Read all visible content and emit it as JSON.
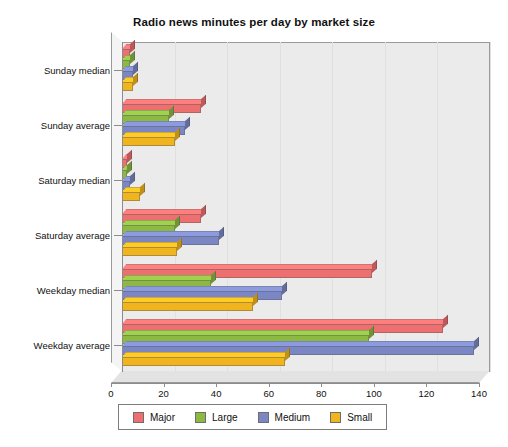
{
  "chart_data": {
    "type": "bar",
    "orientation": "horizontal",
    "title": "Radio news minutes per day by market size",
    "xlabel": "",
    "ylabel": "",
    "xlim": [
      0,
      140
    ],
    "xticks": [
      0,
      20,
      40,
      60,
      80,
      100,
      120,
      140
    ],
    "grid": true,
    "legend_position": "bottom",
    "categories": [
      "Weekday average",
      "Weekday median",
      "Saturday average",
      "Saturday median",
      "Sunday average",
      "Sunday median"
    ],
    "series": [
      {
        "name": "Major",
        "color": "#ee6f6f",
        "values": [
          122,
          95,
          30,
          2,
          30,
          3
        ]
      },
      {
        "name": "Large",
        "color": "#8cb942",
        "values": [
          94,
          34,
          20,
          2,
          18,
          3
        ]
      },
      {
        "name": "Medium",
        "color": "#7b87c4",
        "values": [
          134,
          61,
          37,
          3,
          24,
          4
        ]
      },
      {
        "name": "Small",
        "color": "#f0b41e",
        "values": [
          62,
          50,
          21,
          7,
          20,
          4
        ]
      }
    ]
  },
  "legend": {
    "items": [
      {
        "label": "Major",
        "color": "#ee6f6f"
      },
      {
        "label": "Large",
        "color": "#8cb942"
      },
      {
        "label": "Medium",
        "color": "#7b87c4"
      },
      {
        "label": "Small",
        "color": "#f0b41e"
      }
    ]
  },
  "colors": {
    "plot_background": "#ebebeb",
    "frame": "#9a9a9a",
    "axis": "#8c8c8c",
    "text": "#111111",
    "page_background": "#ffffff"
  }
}
